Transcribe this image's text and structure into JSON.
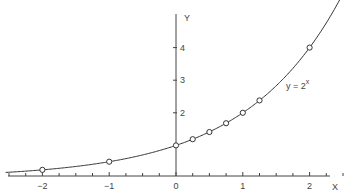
{
  "chart_data": {
    "type": "line",
    "title": "",
    "xlabel": "X",
    "ylabel": "Y",
    "function_label": "y = 2^x",
    "xlim": [
      -2.5,
      2.6
    ],
    "ylim": [
      0,
      4.9
    ],
    "x_ticks": [
      -2,
      -1,
      0,
      1,
      2
    ],
    "x_tick_labels": [
      "−2",
      "−1",
      "0",
      "1",
      "2"
    ],
    "y_ticks": [
      2,
      3,
      4
    ],
    "y_tick_labels": [
      "2",
      "3",
      "4"
    ],
    "minor_tick_step_x": 0.25,
    "grid": false,
    "series": [
      {
        "name": "y = 2^x",
        "marked_points": {
          "x": [
            -2,
            -1,
            0,
            0.25,
            0.5,
            0.75,
            1,
            1.25,
            2
          ],
          "y": [
            0.25,
            0.5,
            1,
            1.19,
            1.41,
            1.68,
            2,
            2.38,
            4
          ]
        }
      }
    ]
  },
  "labels": {
    "x_axis": "X",
    "y_axis": "Y",
    "func_base": "y = 2",
    "func_exp": "x"
  },
  "colors": {
    "line": "#333333",
    "axis": "#444444",
    "background": "#ffffff"
  }
}
